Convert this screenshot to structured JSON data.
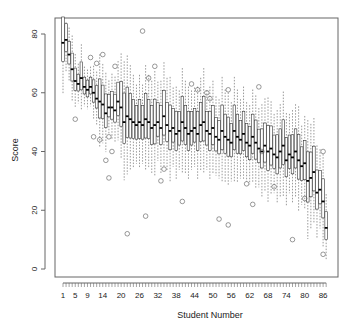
{
  "chart_data": {
    "type": "boxplot",
    "title": "",
    "xlabel": "Student Number",
    "ylabel": "Score",
    "ylim": [
      -3,
      84
    ],
    "yticks": [
      0,
      20,
      40,
      60,
      80
    ],
    "x_tick_labels": [
      "1",
      "5",
      "9",
      "14",
      "20",
      "26",
      "32",
      "38",
      "44",
      "50",
      "56",
      "62",
      "68",
      "74",
      "80",
      "86"
    ],
    "x_tick_label_positions": [
      1,
      5,
      9,
      14,
      20,
      26,
      32,
      38,
      44,
      50,
      56,
      62,
      68,
      74,
      80,
      86
    ],
    "n_students": 87,
    "grid": false,
    "legend": null,
    "medians": [
      77,
      78,
      73,
      68,
      64,
      63,
      65,
      62,
      61,
      62,
      60,
      58,
      57,
      56,
      53,
      55,
      55,
      54,
      57,
      55,
      50,
      52,
      51,
      50,
      49,
      50,
      49,
      51,
      50,
      48,
      49,
      50,
      48,
      52,
      49,
      47,
      48,
      46,
      47,
      50,
      48,
      46,
      47,
      48,
      46,
      49,
      50,
      47,
      46,
      48,
      45,
      44,
      47,
      45,
      44,
      43,
      47,
      45,
      44,
      46,
      43,
      42,
      45,
      43,
      41,
      40,
      42,
      40,
      41,
      39,
      38,
      40,
      42,
      37,
      39,
      38,
      40,
      37,
      35,
      36,
      30,
      31,
      33,
      26,
      27,
      23,
      14
    ],
    "box_half_range": [
      8,
      5,
      4,
      5,
      4,
      3,
      5,
      3,
      3,
      3,
      4,
      4,
      7,
      6,
      6,
      4,
      5,
      5,
      6,
      8,
      9,
      9,
      8,
      7,
      6,
      7,
      6,
      8,
      7,
      7,
      8,
      6,
      7,
      8,
      7,
      8,
      6,
      7,
      6,
      8,
      7,
      7,
      6,
      6,
      7,
      7,
      8,
      6,
      7,
      7,
      6,
      6,
      8,
      7,
      7,
      6,
      8,
      7,
      6,
      7,
      6,
      6,
      7,
      7,
      6,
      7,
      7,
      8,
      7,
      6,
      7,
      7,
      8,
      7,
      6,
      7,
      7,
      8,
      6,
      7,
      9,
      8,
      8,
      7,
      6,
      7,
      5
    ],
    "outliers": [
      {
        "student": 14,
        "value": 73
      },
      {
        "student": 12,
        "value": 70
      },
      {
        "student": 10,
        "value": 72
      },
      {
        "student": 5,
        "value": 51
      },
      {
        "student": 11,
        "value": 45
      },
      {
        "student": 13,
        "value": 44
      },
      {
        "student": 16,
        "value": 45
      },
      {
        "student": 17,
        "value": 40
      },
      {
        "student": 15,
        "value": 37
      },
      {
        "student": 16,
        "value": 31
      },
      {
        "student": 18,
        "value": 69
      },
      {
        "student": 22,
        "value": 12
      },
      {
        "student": 27,
        "value": 81
      },
      {
        "student": 31,
        "value": 69
      },
      {
        "student": 29,
        "value": 65
      },
      {
        "student": 28,
        "value": 18
      },
      {
        "student": 33,
        "value": 30
      },
      {
        "student": 34,
        "value": 34
      },
      {
        "student": 43,
        "value": 63
      },
      {
        "student": 45,
        "value": 61
      },
      {
        "student": 40,
        "value": 23
      },
      {
        "student": 48,
        "value": 60
      },
      {
        "student": 49,
        "value": 58
      },
      {
        "student": 55,
        "value": 61
      },
      {
        "student": 52,
        "value": 17
      },
      {
        "student": 55,
        "value": 15
      },
      {
        "student": 61,
        "value": 29
      },
      {
        "student": 65,
        "value": 62
      },
      {
        "student": 63,
        "value": 22
      },
      {
        "student": 76,
        "value": 10
      },
      {
        "student": 80,
        "value": 24
      },
      {
        "student": 86,
        "value": 40
      },
      {
        "student": 86,
        "value": 5
      },
      {
        "student": 66,
        "value": 40
      },
      {
        "student": 70,
        "value": 28
      }
    ]
  }
}
